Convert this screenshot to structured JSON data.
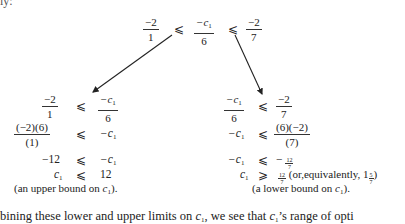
{
  "top_fragment": "ly:",
  "top_inequality": {
    "left": {
      "num": "−2",
      "den": "1"
    },
    "rel1": "⩽",
    "mid": {
      "num": "−c",
      "num_sub": "1",
      "den": "6"
    },
    "rel2": "⩽",
    "right": {
      "num": "−2",
      "den": "7"
    }
  },
  "left_block": {
    "line1": {
      "lhs_num": "−2",
      "lhs_den": "1",
      "rel": "⩽",
      "rhs_num": "−c",
      "rhs_sub": "1",
      "rhs_den": "6"
    },
    "line2": {
      "lhs_num": "(−2)(6)",
      "lhs_den": "(1)",
      "rel": "⩽",
      "rhs": "−c",
      "rhs_sub": "1"
    },
    "line3": {
      "lhs": "−12",
      "rel": "⩽",
      "rhs": "−c",
      "rhs_sub": "1"
    },
    "line4": {
      "lhs": "c",
      "lhs_sub": "1",
      "rel": "⩽",
      "rhs": "12"
    },
    "note_pre": "(an upper bound on ",
    "note_var": "c",
    "note_sub": "1",
    "note_post": ")."
  },
  "right_block": {
    "line1": {
      "lhs_num": "−c",
      "lhs_sub": "1",
      "lhs_den": "6",
      "rel": "⩽",
      "rhs_num": "−2",
      "rhs_den": "7"
    },
    "line2": {
      "lhs": "−c",
      "lhs_sub": "1",
      "rel": "⩽",
      "rhs_num": "(6)(−2)",
      "rhs_den": "(7)"
    },
    "line3": {
      "lhs": "−c",
      "lhs_sub": "1",
      "rel": "⩽",
      "rhs_sign": "−",
      "rhs_num": "12",
      "rhs_den": "7"
    },
    "line4": {
      "lhs": "c",
      "lhs_sub": "1",
      "rel": "⩾",
      "rhs_num": "12",
      "rhs_den": "7",
      "equiv_pre": "(or,equivalently, 1",
      "equiv_num": "5",
      "equiv_den": "7",
      "equiv_post": ")"
    },
    "note_pre": "(a lower bound on ",
    "note_var": "c",
    "note_sub": "1",
    "note_post": ")."
  },
  "bottom_text": {
    "pre": "bining these lower and upper limits on ",
    "var1": "c",
    "sub1": "1",
    "mid": ", we see that ",
    "var2": "c",
    "sub2": "1",
    "post": "’s range of opti"
  }
}
